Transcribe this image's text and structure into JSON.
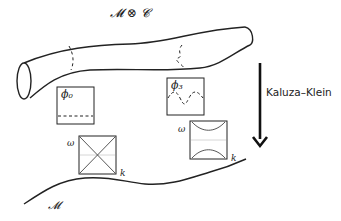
{
  "diagram": {
    "top_label": "𝓜 ⊗ 𝓒",
    "bottom_label": "𝓜",
    "arrow_label": "Kaluza–Klein",
    "mode_boxes": [
      {
        "label": "ϕ₀",
        "mode": "zero-mode-flat"
      },
      {
        "label": "ϕ₃",
        "mode": "third-mode-oscillating"
      }
    ],
    "dispersion_plots": [
      {
        "y_axis": "ω",
        "x_axis": "k",
        "type": "gapless-crossing"
      },
      {
        "y_axis": "ω",
        "x_axis": "k",
        "type": "gapped-hyperbola"
      }
    ],
    "colors": {
      "stroke": "#222222",
      "background": "#ffffff",
      "faint": "#cccccc"
    }
  }
}
